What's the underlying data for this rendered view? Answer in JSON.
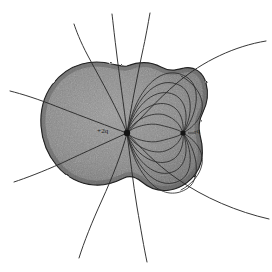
{
  "figure": {
    "kind": "hand-drawn-physics-diagram",
    "background_color": "#ffffff",
    "ink_color": "#262626",
    "shade_color": "#8e8e8e",
    "shade_dark_color": "#6b6b6b",
    "canvas": {
      "width": 272,
      "height": 272
    }
  },
  "charges": [
    {
      "id": "positive-charge",
      "label": "+2q",
      "sign": "positive",
      "magnitude": "2q",
      "x": 127,
      "y": 133,
      "dot_radius": 3.2,
      "label_x": 97,
      "label_y": 128
    },
    {
      "id": "negative-charge",
      "label": "-q",
      "sign": "negative",
      "magnitude": "q",
      "x": 183,
      "y": 133,
      "dot_radius": 2.6,
      "label_x": 194,
      "label_y": 128
    }
  ],
  "shaded_region": {
    "name": "shaded-blob",
    "description": "irregular lobed shaded body enclosing both charges",
    "fill": "#8e8e8e",
    "stroke": "#2b2b2b",
    "outline_path": "M 127 66 C 140 61 152 62 161 67 C 170 72 176 70 184 68 C 194 66 203 72 206 83 C 209 94 207 104 203 112 C 199 120 198 127 200 135 C 203 146 204 157 199 168 C 193 180 182 188 170 190 C 158 192 149 188 142 182 C 136 177 130 175 124 178 C 116 182 106 186 94 185 C 80 184 66 177 57 166 C 47 154 42 140 41 126 C 40 110 44 96 52 85 C 60 74 71 67 82 64 C 93 61 104 62 112 64 C 118 65 123 67 127 66 Z"
  },
  "bound_field_lines": {
    "name": "interior-loop-lines",
    "count": 12,
    "description": "arcs running from the +2q charge to the -q charge, bulging above and below the charge axis"
  },
  "escaping_field_lines": {
    "name": "radiating-lines",
    "count": 9,
    "description": "straight-ish lines radiating from the +2q charge outward past the blob boundary"
  },
  "outer_loops": {
    "name": "outer-bulge-loops",
    "count": 2,
    "description": "two loops that bulge past the right edge of the shaded blob before reaching -q"
  }
}
